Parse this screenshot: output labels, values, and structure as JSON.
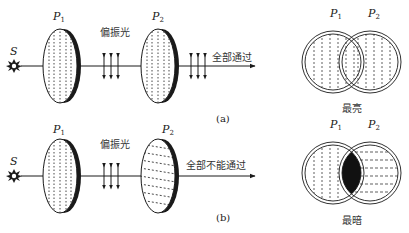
{
  "panel_a": {
    "source_label": "S",
    "polarizer1_label": "P",
    "polarizer1_sub": "1",
    "polarizer2_label": "P",
    "polarizer2_sub": "2",
    "polarized_light_label": "偏振光",
    "result_label": "全部通过",
    "caption": "(a)"
  },
  "panel_b": {
    "source_label": "S",
    "polarizer1_label": "P",
    "polarizer1_sub": "1",
    "polarizer2_label": "P",
    "polarizer2_sub": "2",
    "polarized_light_label": "偏振光",
    "result_label": "全部不能通过",
    "caption": "(b)"
  },
  "overlap_a": {
    "p1_label": "P",
    "p1_sub": "1",
    "p2_label": "P",
    "p2_sub": "2",
    "caption": "最亮"
  },
  "overlap_b": {
    "p1_label": "P",
    "p1_sub": "1",
    "p2_label": "P",
    "p2_sub": "2",
    "caption": "最暗"
  }
}
